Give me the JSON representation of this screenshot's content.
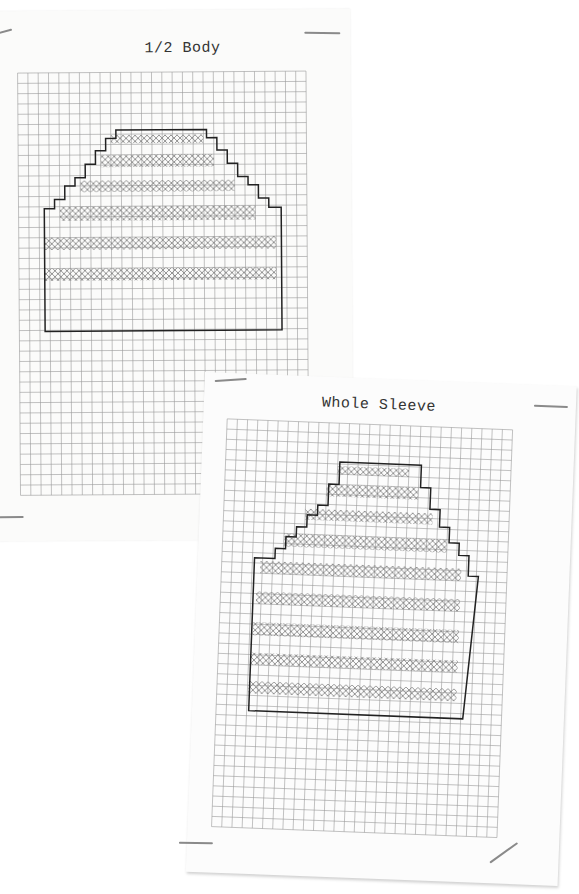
{
  "pages": [
    {
      "title": "1/2 Body",
      "grid": {
        "columns": 27,
        "rows": 41,
        "cell_px": 9.5
      },
      "outline_steps": [
        {
          "row": 4,
          "left": 9,
          "right": 18
        },
        {
          "row": 5,
          "left": 8,
          "right": 19
        },
        {
          "row": 6,
          "left": 7,
          "right": 20
        },
        {
          "row": 7,
          "left": 6,
          "right": 21
        },
        {
          "row": 8,
          "left": 5,
          "right": 22
        },
        {
          "row": 9,
          "left": 4,
          "right": 23
        },
        {
          "row": 10,
          "left": 3,
          "right": 25
        }
      ],
      "shaded_rows": [
        4,
        5.5,
        7,
        8.5,
        10.5,
        12.5
      ],
      "stripe_count": 6
    },
    {
      "title": "Whole Sleeve",
      "grid": {
        "columns": 27,
        "rows": 42,
        "cell_px": 9.5
      },
      "stripe_count": 9
    }
  ],
  "colors": {
    "paper": "#fbfbfa",
    "grid_line": "#9a9a9a",
    "outline": "#222222",
    "hatch": "#888888",
    "staple": "#8a8a8a"
  }
}
